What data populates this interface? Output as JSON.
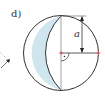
{
  "figure": {
    "part_label": "d)",
    "dimension_label": "a",
    "colors": {
      "outline": "#333333",
      "lune_fill": "#cfe6ef",
      "chord": "#999999",
      "marker": "#d44a5a",
      "background": "#ffffff"
    },
    "elements": [
      "circle",
      "shaded-crescent-lune",
      "vertical-diameter-chord",
      "horizontal-radius",
      "right-angle-marker",
      "dimension-arrow-a",
      "partial-arrow-left-edge"
    ]
  }
}
